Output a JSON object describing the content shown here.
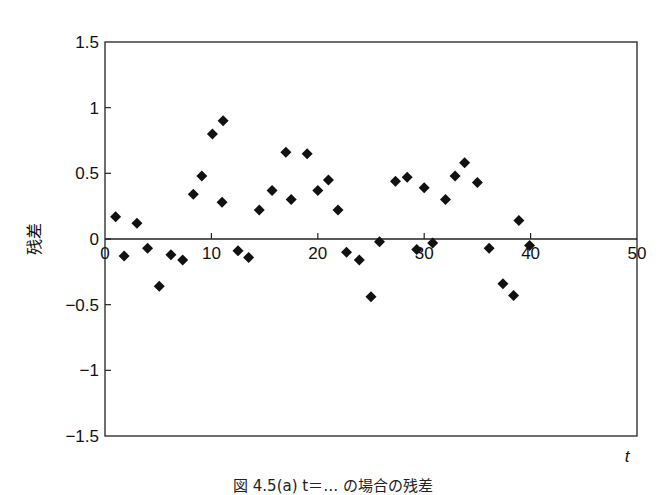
{
  "figure": {
    "caption": "図 4.5(a)  t＝… の場合の残差"
  },
  "chart_data": {
    "type": "scatter",
    "title": "",
    "xlabel": "t",
    "ylabel": "残差",
    "xlim": [
      0,
      50
    ],
    "ylim": [
      -1.5,
      1.5
    ],
    "xticks": [
      0,
      10,
      20,
      30,
      40,
      50
    ],
    "xtick_labels": [
      "0",
      "10",
      "20",
      "30",
      "40",
      "50"
    ],
    "yticks": [
      1.5,
      1,
      0.5,
      0,
      -0.5,
      -1,
      -1.5
    ],
    "ytick_labels": [
      "1.5",
      "1",
      "0.5",
      "0",
      "−0.5",
      "−1",
      "−1.5"
    ],
    "grid": false,
    "legend": null,
    "marker": "diamond",
    "marker_color": "#111111",
    "series": [
      {
        "name": "残差",
        "x": [
          1.0,
          1.8,
          3.0,
          4.0,
          5.1,
          6.2,
          7.3,
          8.3,
          9.1,
          10.1,
          11.1,
          11.0,
          12.5,
          13.5,
          14.5,
          15.7,
          17.0,
          17.5,
          19.0,
          20.0,
          21.0,
          21.9,
          22.7,
          23.9,
          25.0,
          25.8,
          27.3,
          28.4,
          29.3,
          30.0,
          30.8,
          32.0,
          32.9,
          33.8,
          35.0,
          36.1,
          37.4,
          38.4,
          38.9,
          39.9
        ],
        "y": [
          0.17,
          -0.13,
          0.12,
          -0.07,
          -0.36,
          -0.12,
          -0.16,
          0.34,
          0.48,
          0.8,
          0.9,
          0.28,
          -0.09,
          -0.14,
          0.22,
          0.37,
          0.66,
          0.3,
          0.65,
          0.37,
          0.45,
          0.22,
          -0.1,
          -0.16,
          -0.44,
          -0.02,
          0.44,
          0.47,
          -0.08,
          0.39,
          -0.03,
          0.3,
          0.48,
          0.58,
          0.43,
          -0.07,
          -0.34,
          -0.43,
          0.14,
          -0.05
        ]
      }
    ]
  }
}
